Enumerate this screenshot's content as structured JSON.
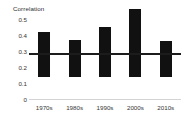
{
  "chart_data": {
    "type": "bar",
    "title": "Correlation",
    "xlabel": "",
    "ylabel": "",
    "categories": [
      "1970s",
      "1980s",
      "1990s",
      "2000s",
      "2010s"
    ],
    "values": [
      0.28,
      0.23,
      0.31,
      0.42,
      0.22
    ],
    "series": [
      {
        "name": "Correlation",
        "values": [
          0.28,
          0.23,
          0.31,
          0.42,
          0.22
        ]
      }
    ],
    "ylim": [
      0,
      0.5
    ],
    "ytick_labels": [
      "0.5",
      "0.4",
      "0.3",
      "0.2",
      "0.1",
      "0"
    ],
    "ytick_values": [
      0.5,
      0.4,
      0.3,
      0.2,
      0.1,
      0
    ],
    "grid": false,
    "legend": "none",
    "bar_color": "#111111",
    "reference_line": {
      "label": "",
      "value": 0.29,
      "color": "#1c1c1c"
    },
    "background_color": "#ffffff",
    "axis_color": "#d4d4d4"
  }
}
